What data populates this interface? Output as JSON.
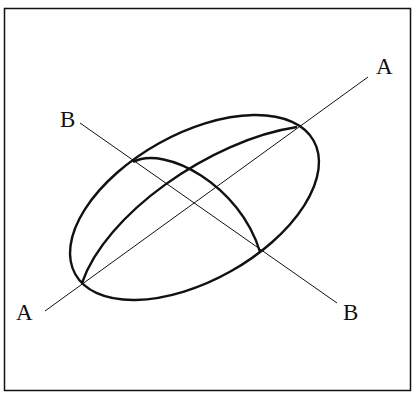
{
  "diagram": {
    "type": "ellipsoid-with-axes",
    "colors": {
      "stroke": "#111111",
      "background": "#ffffff"
    },
    "frame": {
      "x": 4.5,
      "y": 8.5,
      "width": 406,
      "height": 382
    },
    "ellipse": {
      "cx": 194.5,
      "cy": 207.5,
      "rx": 136.6,
      "ry": 73.4,
      "rotation_deg": -29.25
    },
    "axes": [
      {
        "name": "A",
        "x1": 45,
        "y1": 311,
        "x2": 368,
        "y2": 77
      },
      {
        "name": "B",
        "x1": 80,
        "y1": 123,
        "x2": 337,
        "y2": 303
      }
    ],
    "labels": {
      "a_top": "A",
      "a_bottom": "A",
      "b_top": "B",
      "b_bottom": "B"
    }
  }
}
